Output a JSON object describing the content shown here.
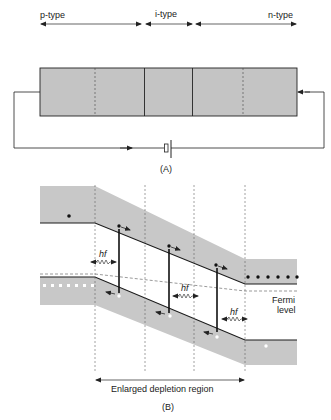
{
  "panel_a": {
    "region_labels": {
      "p": "p-type",
      "i": "i-type",
      "n": "n-type"
    },
    "caption": "(A)",
    "colors": {
      "fill": "#c4c4c4",
      "line": "#222222"
    }
  },
  "panel_b": {
    "photon_label": "hf",
    "fermi_label_line1": "Fermi",
    "fermi_label_line2": "level",
    "depletion_label": "Enlarged depletion region",
    "caption": "(B)",
    "colors": {
      "band_fill": "#c8c8c8",
      "line": "#1a1a1a"
    }
  }
}
